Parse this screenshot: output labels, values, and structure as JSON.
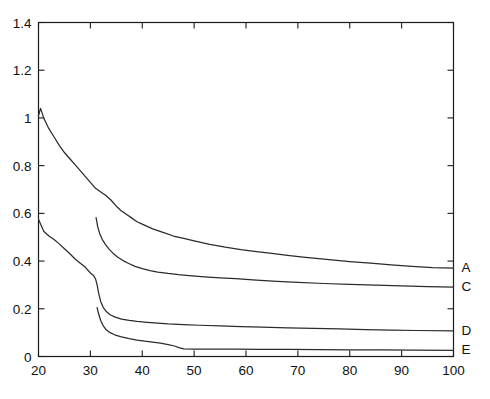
{
  "chart_data": {
    "type": "line",
    "title": "",
    "xlabel": "",
    "ylabel": "",
    "xlim": [
      20,
      100
    ],
    "ylim": [
      0,
      1.4
    ],
    "grid": false,
    "legend_position": "right-inline-end-labels",
    "xticks": [
      20,
      30,
      40,
      50,
      60,
      70,
      80,
      90,
      100
    ],
    "xtick_labels": [
      "20",
      "30",
      "40",
      "50",
      "60",
      "70",
      "80",
      "90",
      "100"
    ],
    "yticks": [
      0,
      0.2,
      0.4,
      0.6,
      0.8,
      1,
      1.2,
      1.4
    ],
    "ytick_labels": [
      "0",
      "0.2",
      "0.4",
      "0.6",
      "0.8",
      "1",
      "1.2",
      "1.4"
    ],
    "series": [
      {
        "name": "A",
        "label": "A",
        "color": "#2b2b2b",
        "end_label_value": 0.37,
        "x": [
          20,
          20.4,
          21,
          22,
          23,
          24,
          25,
          26,
          27,
          28,
          29,
          30,
          31,
          32,
          33,
          34,
          35,
          36,
          37,
          38,
          39,
          40,
          42,
          44,
          46,
          48,
          50,
          53,
          56,
          59,
          62,
          65,
          68,
          71,
          74,
          77,
          80,
          84,
          88,
          92,
          96,
          100
        ],
        "y": [
          1.01,
          1.04,
          1.0,
          0.955,
          0.92,
          0.885,
          0.855,
          0.83,
          0.805,
          0.78,
          0.755,
          0.73,
          0.705,
          0.69,
          0.675,
          0.655,
          0.63,
          0.61,
          0.595,
          0.58,
          0.565,
          0.555,
          0.535,
          0.52,
          0.505,
          0.495,
          0.485,
          0.47,
          0.458,
          0.448,
          0.44,
          0.432,
          0.424,
          0.417,
          0.41,
          0.404,
          0.398,
          0.391,
          0.384,
          0.378,
          0.373,
          0.37
        ]
      },
      {
        "name": "C",
        "label": "C",
        "color": "#2b2b2b",
        "end_label_value": 0.29,
        "x": [
          31.1,
          31.4,
          31.8,
          32.3,
          32.9,
          33.6,
          34.4,
          35.3,
          36.3,
          37.4,
          38.6,
          40,
          41.5,
          43,
          45,
          47,
          49,
          52,
          55,
          58,
          62,
          66,
          70,
          75,
          80,
          85,
          90,
          95,
          100
        ],
        "y": [
          0.582,
          0.545,
          0.515,
          0.49,
          0.47,
          0.45,
          0.432,
          0.416,
          0.402,
          0.39,
          0.378,
          0.368,
          0.36,
          0.354,
          0.348,
          0.343,
          0.339,
          0.334,
          0.33,
          0.326,
          0.32,
          0.315,
          0.311,
          0.306,
          0.302,
          0.299,
          0.296,
          0.293,
          0.291
        ]
      },
      {
        "name": "D",
        "label": "D",
        "color": "#2b2b2b",
        "end_label_value": 0.105,
        "x": [
          20,
          21,
          22,
          23,
          24,
          25,
          26,
          27,
          28,
          29,
          30,
          30.6,
          31,
          31.3,
          31.6,
          32,
          32.5,
          33,
          33.8,
          34.8,
          36,
          37.5,
          39,
          41,
          43,
          45,
          48,
          51,
          55,
          59,
          63,
          68,
          73,
          78,
          83,
          88,
          93,
          100
        ],
        "y": [
          0.575,
          0.525,
          0.505,
          0.49,
          0.472,
          0.452,
          0.432,
          0.41,
          0.392,
          0.375,
          0.35,
          0.34,
          0.325,
          0.3,
          0.265,
          0.23,
          0.205,
          0.19,
          0.175,
          0.165,
          0.157,
          0.151,
          0.147,
          0.143,
          0.14,
          0.137,
          0.134,
          0.131,
          0.128,
          0.125,
          0.123,
          0.12,
          0.118,
          0.116,
          0.113,
          0.111,
          0.109,
          0.107
        ]
      },
      {
        "name": "E",
        "label": "E",
        "color": "#2b2b2b",
        "end_label_value": 0.025,
        "x": [
          31.3,
          31.6,
          32,
          32.5,
          33,
          33.8,
          34.8,
          36,
          37.5,
          39,
          40.5,
          42,
          43.5,
          45,
          46.2,
          47.2,
          48,
          50,
          54,
          58,
          63,
          68,
          74,
          80,
          86,
          92,
          100
        ],
        "y": [
          0.205,
          0.178,
          0.15,
          0.128,
          0.113,
          0.1,
          0.09,
          0.082,
          0.075,
          0.069,
          0.064,
          0.06,
          0.056,
          0.05,
          0.044,
          0.036,
          0.032,
          0.031,
          0.031,
          0.031,
          0.03,
          0.03,
          0.029,
          0.028,
          0.028,
          0.027,
          0.026
        ]
      }
    ]
  },
  "plot": {
    "background_color": "#ffffff",
    "axis_color": "#1a1a1a",
    "line_color": "#2b2b2b"
  }
}
